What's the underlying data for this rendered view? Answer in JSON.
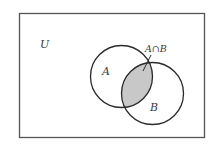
{
  "diagram": {
    "type": "venn",
    "colors": {
      "stroke": "#2a2a2a",
      "frame": "#555555",
      "intersection_fill": "#c8c8c8",
      "background": "#ffffff"
    },
    "universe": {
      "label": "U"
    },
    "sets": [
      {
        "id": "A",
        "label": "A"
      },
      {
        "id": "B",
        "label": "B"
      }
    ],
    "intersection": {
      "label": "A∩B",
      "shaded": true
    }
  }
}
